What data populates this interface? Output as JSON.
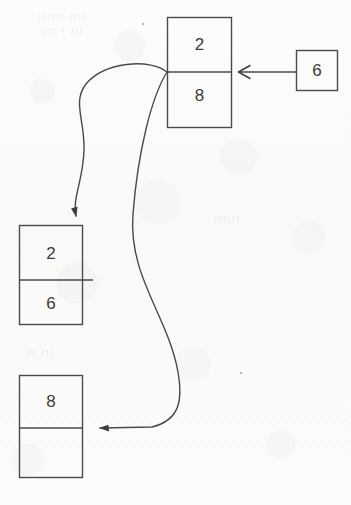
{
  "canvas": {
    "width": 351,
    "height": 505,
    "background": "#fbfbfa",
    "ink": "#4a4a4a"
  },
  "diagram": {
    "type": "node-pointer-diagram",
    "nodes": [
      {
        "id": "node-top",
        "name": "top-node",
        "x": 167,
        "y": 17,
        "width": 65,
        "height": 111,
        "divider_y": 72,
        "cells": [
          {
            "name": "top-node-upper-cell",
            "value": "2"
          },
          {
            "name": "top-node-lower-cell",
            "value": "8"
          }
        ]
      },
      {
        "id": "node-right",
        "name": "right-node",
        "x": 296,
        "y": 50,
        "width": 42,
        "height": 41,
        "divider_y": null,
        "cells": [
          {
            "name": "right-node-cell",
            "value": "6"
          }
        ]
      },
      {
        "id": "node-middle-left",
        "name": "middle-left-node",
        "x": 19,
        "y": 225,
        "width": 64,
        "height": 100,
        "divider_y": 280,
        "cells": [
          {
            "name": "middle-left-node-upper-cell",
            "value": "2"
          },
          {
            "name": "middle-left-node-lower-cell",
            "value": "6"
          }
        ]
      },
      {
        "id": "node-bottom-left",
        "name": "bottom-left-node",
        "x": 19,
        "y": 375,
        "width": 64,
        "height": 103,
        "divider_y": 428,
        "cells": [
          {
            "name": "bottom-left-node-upper-cell",
            "value": "8"
          },
          {
            "name": "bottom-left-node-lower-cell",
            "value": ""
          }
        ]
      }
    ],
    "connectors": [
      {
        "id": "arrow-right-to-top",
        "name": "arrow-right-node-to-top-node",
        "from": "node-right",
        "to": "node-top",
        "style": "straight",
        "arrowhead": "open-chevron",
        "direction": "left"
      },
      {
        "id": "curve-top-to-middle",
        "name": "curve-top-node-to-middle-left-node",
        "from": "node-top",
        "to": "node-middle-left",
        "style": "curved",
        "arrowhead": "solid-triangle",
        "direction": "down-left"
      },
      {
        "id": "curve-top-to-bottom",
        "name": "curve-top-node-to-bottom-left-node",
        "from": "node-top",
        "to": "node-bottom-left",
        "style": "curved-s",
        "arrowhead": "solid-triangle",
        "direction": "left"
      }
    ],
    "ghost_marks": [
      {
        "text": "tttt  tttttt",
        "x": 36,
        "y": 16
      },
      {
        "text": "ttt t ttt",
        "x": 40,
        "y": 30
      },
      {
        "text": "tttttt",
        "x": 210,
        "y": 218
      },
      {
        "text": "ttt tt",
        "x": 26,
        "y": 350
      }
    ]
  }
}
